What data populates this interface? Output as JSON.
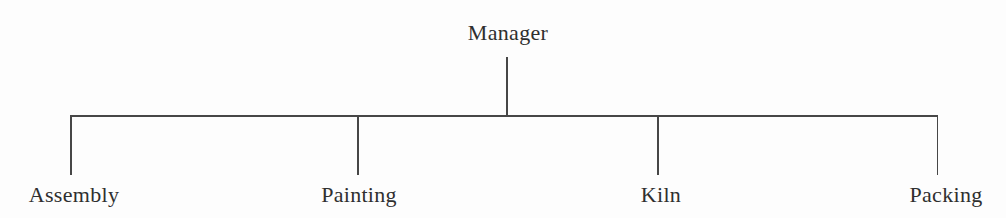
{
  "chart": {
    "type": "org-tree",
    "root": {
      "label": "Manager"
    },
    "children": [
      {
        "label": "Assembly"
      },
      {
        "label": "Painting"
      },
      {
        "label": "Kiln"
      },
      {
        "label": "Packing"
      }
    ]
  },
  "colors": {
    "background": "#fdfdfd",
    "text": "#2f2f2f",
    "line": "#474747"
  }
}
